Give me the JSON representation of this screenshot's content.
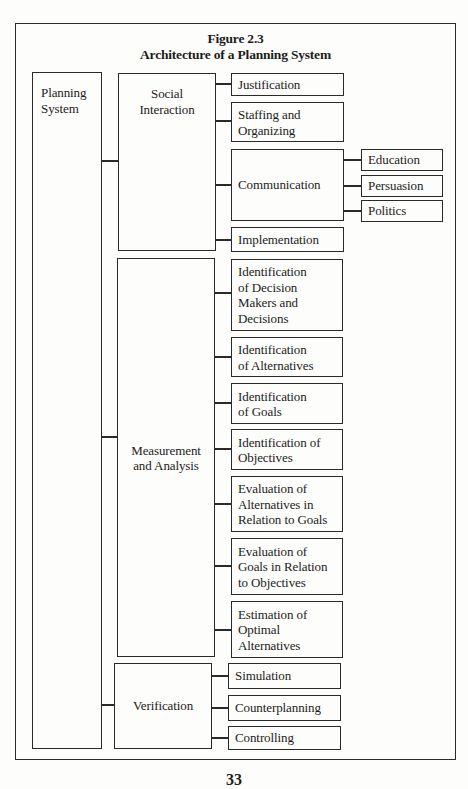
{
  "figure": {
    "number": "Figure 2.3",
    "title": "Architecture of a Planning System"
  },
  "root": {
    "label": "Planning\nSystem"
  },
  "branches": [
    {
      "label": "Social\nInteraction",
      "children": [
        {
          "label": "Justification"
        },
        {
          "label": "Staffing and\nOrganizing"
        },
        {
          "label": "Communication",
          "children": [
            {
              "label": "Education"
            },
            {
              "label": "Persuasion"
            },
            {
              "label": "Politics"
            }
          ]
        },
        {
          "label": "Implementation"
        }
      ]
    },
    {
      "label": "Measurement\nand Analysis",
      "children": [
        {
          "label": "Identification\nof Decision\nMakers and\nDecisions"
        },
        {
          "label": "Identification\nof Alternatives"
        },
        {
          "label": "Identification\nof Goals"
        },
        {
          "label": "Identification of\nObjectives"
        },
        {
          "label": "Evaluation of\nAlternatives in\nRelation to Goals"
        },
        {
          "label": "Evaluation of\nGoals in Relation\nto Objectives"
        },
        {
          "label": "Estimation of\nOptimal\nAlternatives"
        }
      ]
    },
    {
      "label": "Verification",
      "children": [
        {
          "label": "Simulation"
        },
        {
          "label": "Counterplanning"
        },
        {
          "label": "Controlling"
        }
      ]
    }
  ],
  "page": {
    "number": "33"
  }
}
